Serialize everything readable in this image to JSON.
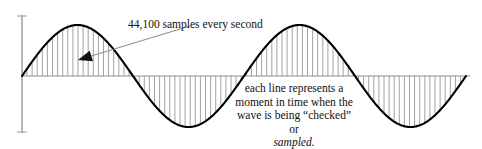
{
  "figure": {
    "annotations": {
      "sample_rate_label": "44,100 samples every second",
      "caption_line_1": "each line represents a",
      "caption_line_2": "moment in time when the",
      "caption_line_3": "wave is being “checked” or",
      "caption_line_4_italic": "sampled."
    },
    "colors": {
      "wave_stroke": "#000000",
      "sample_line": "#8a8a8a",
      "axis": "#9a9a9a",
      "baseline": "#8f8f8f",
      "arrow_line": "#8a8a8a",
      "arrow_head": "#111111",
      "text": "#111111",
      "background": "#ffffff"
    },
    "icons": {
      "arrow": "arrow-pointer-icon"
    }
  },
  "chart_data": {
    "type": "line",
    "xlabel": "",
    "ylabel": "",
    "grid": false,
    "legend": null,
    "axis": {
      "baseline_y_px": 76,
      "vertical_axis_x_px": 22,
      "vertical_axis_top_px": 15,
      "vertical_axis_bottom_px": 133,
      "baseline_x_start_px": 22,
      "baseline_x_end_px": 470
    },
    "wave": {
      "form": "sine",
      "cycles": 2,
      "start_x_px": 22,
      "end_x_px": 466,
      "amplitude_px": 51,
      "peak_y_px": 24,
      "trough_y_px": 127,
      "period_px": 222,
      "stroke_width_px": 2
    },
    "samples": {
      "description": "vertical stems drawn from the baseline to the wave at regular intervals",
      "spacing_px": 5.1,
      "count": 88,
      "stroke_width_px": 0.8,
      "first_x_px": 27,
      "last_x_px": 464
    },
    "arrow": {
      "from_x_px": 190,
      "from_y_px": 26,
      "to_x_px": 78,
      "to_y_px": 60
    }
  }
}
